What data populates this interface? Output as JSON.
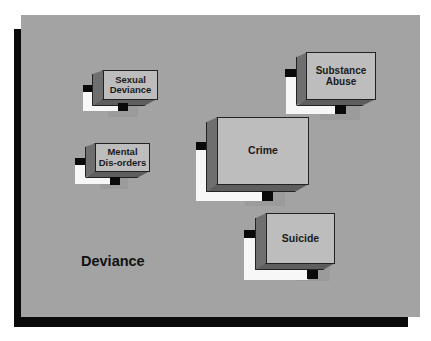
{
  "diagram": {
    "title": "Deviance",
    "nodes": [
      {
        "id": "sexual-deviance",
        "label": "Sexual Deviance"
      },
      {
        "id": "substance-abuse",
        "label": "Substance Abuse"
      },
      {
        "id": "mental-disorders",
        "label": "Mental Dis-orders"
      },
      {
        "id": "crime",
        "label": "Crime"
      },
      {
        "id": "suicide",
        "label": "Suicide"
      }
    ],
    "colors": {
      "panel": "#a3a3a3",
      "shadow": "#0a0a0a",
      "box_front": "#bdbdbd",
      "box_side": "#6f6f6f",
      "accent_white": "#f7f7f7"
    }
  }
}
